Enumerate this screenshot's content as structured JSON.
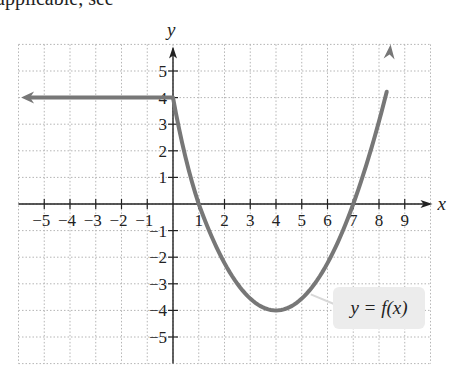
{
  "top_text": {
    "visible": "applicable, see",
    "faint": " the ... section"
  },
  "chart_data": {
    "type": "line",
    "title": "",
    "xlabel": "x",
    "ylabel": "y",
    "xlim": [
      -6,
      10
    ],
    "ylim": [
      -6,
      6
    ],
    "grid": true,
    "x_tick_labels": [
      "−5",
      "−4",
      "−3",
      "−2",
      "−1",
      "1",
      "2",
      "3",
      "4",
      "5",
      "6",
      "7",
      "8",
      "9"
    ],
    "x_ticks": [
      -5,
      -4,
      -3,
      -2,
      -1,
      1,
      2,
      3,
      4,
      5,
      6,
      7,
      8,
      9
    ],
    "y_tick_labels": [
      "5",
      "4",
      "3",
      "2",
      "1",
      "−1",
      "−2",
      "−3",
      "−4",
      "−5"
    ],
    "y_ticks": [
      5,
      4,
      3,
      2,
      1,
      -1,
      -2,
      -3,
      -4,
      -5
    ],
    "series": [
      {
        "name": "y = f(x)",
        "color": "#777777",
        "segments": [
          {
            "description": "horizontal ray y=4 for x ≤ 0 (arrow to the left)",
            "x": [
              -5.9,
              0
            ],
            "y": [
              4,
              4
            ]
          },
          {
            "description": "curve decreasing from (0,4) through (1,0) to minimum (4,-4), rising through (7,0) toward arrow at top",
            "x": [
              0,
              1,
              2,
              3,
              4,
              5,
              6,
              7,
              8,
              8.4
            ],
            "y": [
              4,
              0,
              -2.2,
              -3.6,
              -4,
              -3.6,
              -2.2,
              0,
              3.1,
              5.9
            ]
          }
        ]
      }
    ],
    "annotations": [
      {
        "text": "y = f(x)",
        "near": [
          7,
          -3
        ]
      }
    ]
  },
  "label": {
    "function": "y = f(x)"
  }
}
